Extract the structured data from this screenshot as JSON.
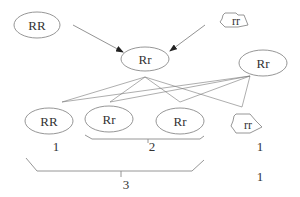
{
  "diagram": {
    "type": "genetic-cross",
    "parents": {
      "left": {
        "genotype": "RR",
        "shape": "ellipse"
      },
      "right": {
        "genotype": "rr",
        "shape": "wrinkled"
      }
    },
    "f1": {
      "genotype": "Rr",
      "shape": "ellipse"
    },
    "f1_second": {
      "genotype": "Rr",
      "shape": "ellipse"
    },
    "offspring": [
      {
        "genotype": "RR",
        "shape": "ellipse",
        "count": "1"
      },
      {
        "genotype": "Rr",
        "shape": "ellipse"
      },
      {
        "genotype": "Rr",
        "shape": "ellipse"
      },
      {
        "genotype": "rr",
        "shape": "wrinkled",
        "count": "1"
      }
    ],
    "group_2_count": "2",
    "group_3_count": "3",
    "right_bottom_count": "1",
    "colors": {
      "stroke": "#8a8a8a",
      "text": "#333333",
      "background": "#ffffff"
    }
  }
}
